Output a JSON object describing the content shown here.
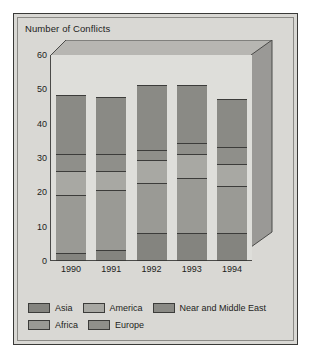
{
  "chart_data": {
    "type": "bar",
    "subtype": "stacked",
    "title": "Number of Conflicts",
    "xlabel": "",
    "ylabel": "",
    "ylim": [
      0,
      60
    ],
    "yticks": [
      0,
      10,
      20,
      30,
      40,
      50,
      60
    ],
    "grid": false,
    "legend_position": "bottom",
    "categories": [
      "1990",
      "1991",
      "1992",
      "1993",
      "1994"
    ],
    "series": [
      {
        "name": "Asia",
        "values": [
          2,
          3,
          8,
          8,
          8
        ]
      },
      {
        "name": "Africa",
        "values": [
          17,
          17.5,
          14.5,
          16,
          13.5
        ]
      },
      {
        "name": "America",
        "values": [
          7,
          5.5,
          6.5,
          7,
          6.5
        ]
      },
      {
        "name": "Europe",
        "values": [
          5,
          5,
          3,
          3,
          5
        ]
      },
      {
        "name": "Near and Middle East",
        "values": [
          17,
          16.5,
          19,
          17,
          14
        ]
      }
    ],
    "totals": [
      48,
      47.5,
      51,
      51,
      47
    ],
    "stack_boundaries": {
      "1990": [
        0,
        2,
        19,
        26,
        31,
        48
      ],
      "1991": [
        0,
        3,
        20.5,
        26,
        31,
        47.5
      ],
      "1992": [
        0,
        8,
        22.5,
        29,
        32,
        51
      ],
      "1993": [
        0,
        8,
        24,
        31,
        34,
        51
      ],
      "1994": [
        0,
        8,
        21.5,
        28,
        33,
        47
      ]
    }
  },
  "colors": {
    "page_background": "#ffffff",
    "panel_background": "#d9d8d4",
    "plot_background": "#dededa",
    "frame_border": "#3a3a38",
    "axis_line": "#4a4a48",
    "text": "#1d1d1b",
    "wall_top": "#b7b6b2",
    "wall_right": "#9a9996",
    "series": {
      "Asia": "#84847f",
      "Africa": "#9a9a95",
      "America": "#a8a8a3",
      "Europe": "#8f8f8a",
      "Near and Middle East": "#8a8a85"
    }
  },
  "legend": {
    "rows": [
      [
        {
          "label": "Asia",
          "swatch": "#84847f"
        },
        {
          "label": "America",
          "swatch": "#a8a8a3"
        },
        {
          "label": "Near and Middle East",
          "swatch": "#8a8a85"
        }
      ],
      [
        {
          "label": "Africa",
          "swatch": "#9a9a95"
        },
        {
          "label": "Europe",
          "swatch": "#8f8f8a"
        }
      ]
    ]
  }
}
